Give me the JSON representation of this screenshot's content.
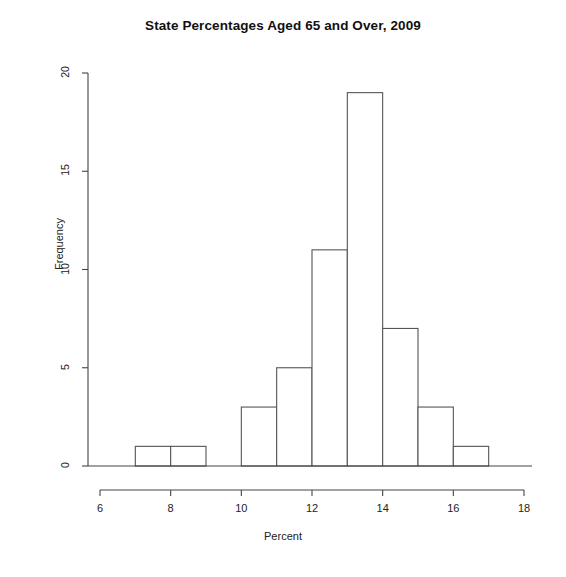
{
  "chart_data": {
    "type": "bar",
    "title": "State Percentages Aged 65 and Over, 2009",
    "xlabel": "Percent",
    "ylabel": "Frequency",
    "bin_width": 1,
    "bin_edges": [
      6,
      7,
      8,
      9,
      10,
      11,
      12,
      13,
      14,
      15,
      16,
      17,
      18
    ],
    "categories": [
      "6-7",
      "7-8",
      "8-9",
      "9-10",
      "10-11",
      "11-12",
      "12-13",
      "13-14",
      "14-15",
      "15-16",
      "16-17",
      "17-18"
    ],
    "values": [
      0,
      1,
      1,
      0,
      3,
      5,
      11,
      19,
      7,
      3,
      1,
      0
    ],
    "xlim": [
      6,
      18
    ],
    "ylim": [
      0,
      20
    ],
    "xticks": [
      6,
      8,
      10,
      12,
      14,
      16,
      18
    ],
    "yticks": [
      0,
      5,
      10,
      15,
      20
    ],
    "xtick_labels": [
      "6",
      "8",
      "10",
      "12",
      "14",
      "16",
      "18"
    ],
    "ytick_labels": [
      "0",
      "5",
      "10",
      "15",
      "20"
    ],
    "grid": false,
    "legend": null,
    "bar_fill_color": "#ffffff",
    "bar_edge_color": "#555555",
    "axis_color": "#444444",
    "text_color": "#1a1a1a"
  }
}
